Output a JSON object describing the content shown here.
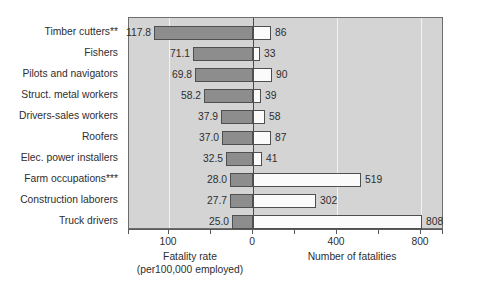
{
  "chart_data": {
    "type": "bar",
    "title": "",
    "subtitle": "",
    "orientation": "horizontal-bidirectional",
    "grid": true,
    "legend_position": "none",
    "categories": [
      "Timber cutters**",
      "Fishers",
      "Pilots and navigators",
      "Struct. metal workers",
      "Drivers-sales workers",
      "Roofers",
      "Elec. power installers",
      "Farm occupations***",
      "Construction laborers",
      "Truck drivers"
    ],
    "series": [
      {
        "name": "Fatality rate",
        "side": "left",
        "axis_label": "Fatality rate",
        "axis_sublabel": "(per100,000 employed)",
        "values": [
          117.8,
          71.1,
          69.8,
          58.2,
          37.9,
          37.0,
          32.5,
          28.0,
          27.7,
          25.0
        ],
        "value_labels": [
          "117.8",
          "71.1",
          "69.8",
          "58.2",
          "37.9",
          "37.0",
          "32.5",
          "28.0",
          "27.7",
          "25.0"
        ],
        "tick_values": [
          100,
          0
        ],
        "tick_labels": [
          "100",
          "0"
        ],
        "range": [
          148,
          0
        ]
      },
      {
        "name": "Number of fatalities",
        "side": "right",
        "axis_label": "Number of fatalities",
        "axis_sublabel": "",
        "values": [
          86,
          33,
          90,
          39,
          58,
          87,
          41,
          519,
          302,
          808
        ],
        "value_labels": [
          "86",
          "33",
          "90",
          "39",
          "58",
          "87",
          "41",
          "519",
          "302",
          "808"
        ],
        "tick_values": [
          0,
          400,
          800
        ],
        "tick_labels": [
          "0",
          "400",
          "800"
        ],
        "range": [
          0,
          905
        ]
      }
    ],
    "colors": {
      "plot_background": "#d4d4d4",
      "left_bar_fill": "#8d8d8d",
      "right_bar_fill": "#fbfbfb",
      "bar_border": "#4f4f4f",
      "gridline": "#f2f2f2",
      "zeroline": "#4a4a4a",
      "text": "#2e2e2e",
      "page_background": "#ffffff"
    }
  }
}
